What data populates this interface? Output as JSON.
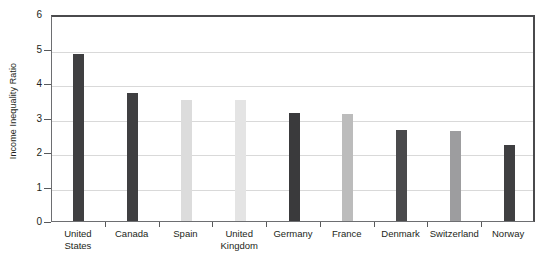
{
  "chart_data": {
    "type": "bar",
    "title": "",
    "xlabel": "",
    "ylabel": "Income Inequality Ratio",
    "ylim": [
      0,
      6
    ],
    "yticks": [
      0,
      1,
      2,
      3,
      4,
      5,
      6
    ],
    "ytick_labels": [
      "0",
      "1",
      "2",
      "3",
      "4",
      "5",
      "6"
    ],
    "grid": true,
    "legend": "none",
    "categories": [
      "United States",
      "Canada",
      "Spain",
      "United Kingdom",
      "Germany",
      "France",
      "Denmark",
      "Switzerland",
      "Norway"
    ],
    "category_lines": [
      [
        "United",
        "States"
      ],
      [
        "Canada",
        ""
      ],
      [
        "Spain",
        ""
      ],
      [
        "United",
        "Kingdom"
      ],
      [
        "Germany",
        ""
      ],
      [
        "France",
        ""
      ],
      [
        "Denmark",
        ""
      ],
      [
        "Switzerland",
        ""
      ],
      [
        "Norway",
        ""
      ]
    ],
    "values": [
      4.85,
      3.72,
      3.51,
      3.51,
      3.12,
      3.09,
      2.63,
      2.6,
      2.2
    ],
    "bar_colors": [
      "#3f3f41",
      "#3f3f41",
      "#dcdcdc",
      "#e4e4e4",
      "#3a3a3c",
      "#bcbcbc",
      "#4a4a4c",
      "#9d9d9f",
      "#3f3f41"
    ]
  },
  "axis": {
    "gridline_color": "#d9d9d9",
    "frame_color": "#4a4a4c",
    "tick_color": "#58595b",
    "text_color": "#231f20"
  }
}
